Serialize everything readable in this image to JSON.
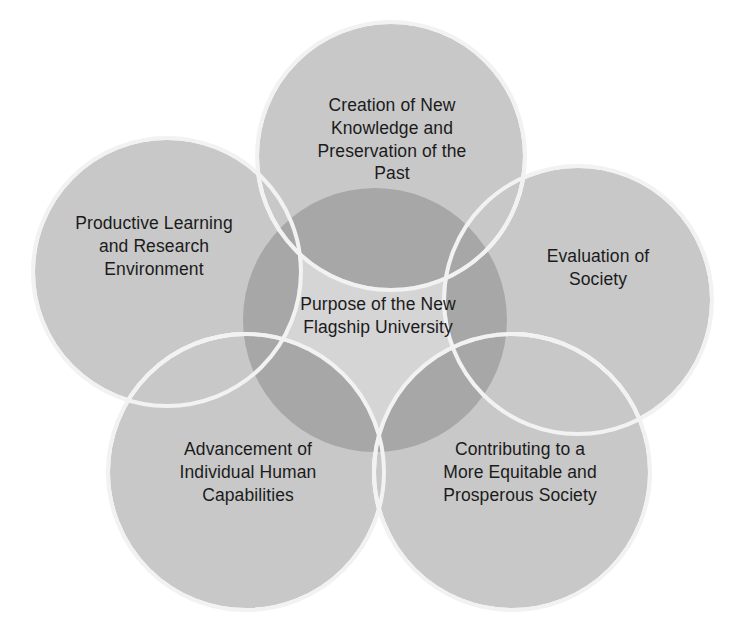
{
  "diagram": {
    "title": "Purpose of the New Flagship University",
    "type": "venn-flower",
    "background_color": "#ffffff",
    "petal_fill_color": "#c8c8c8",
    "overlap_fill_color": "#9a9a9a",
    "stroke_color": "#ffffff",
    "text_color": "#1b1b1b",
    "center": {
      "id": "center-core",
      "label": "Purpose of the New\nFlagship University",
      "name": "purpose-of-the-new-flagship-university"
    },
    "petals": [
      {
        "id": "petal-top",
        "position": "top",
        "label": "Creation of New\nKnowledge and\nPreservation of the\nPast",
        "name": "creation-of-new-knowledge-and-preservation-of-the-past"
      },
      {
        "id": "petal-left",
        "position": "upper-left",
        "label": "Productive Learning\nand Research\nEnvironment",
        "name": "productive-learning-and-research-environment"
      },
      {
        "id": "petal-right",
        "position": "upper-right",
        "label": "Evaluation of\nSociety",
        "name": "evaluation-of-society"
      },
      {
        "id": "petal-bottom-left",
        "position": "lower-left",
        "label": "Advancement of\nIndividual Human\nCapabilities",
        "name": "advancement-of-individual-human-capabilities"
      },
      {
        "id": "petal-bottom-right",
        "position": "lower-right",
        "label": "Contributing to a\nMore Equitable and\nProsperous Society",
        "name": "contributing-to-a-more-equitable-and-prosperous-society"
      }
    ]
  }
}
